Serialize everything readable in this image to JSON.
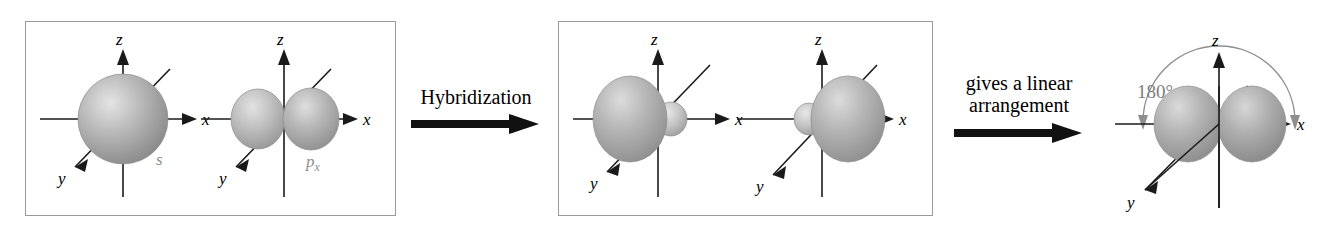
{
  "figure": {
    "background_color": "#ffffff",
    "panel_border_color": "#9a9a9a",
    "orbital_fill_color": "#a8a8a8",
    "orbital_highlight_color": "#dcdcdc",
    "axis_color": "#1a1a1a",
    "label_gray": "#8e8e8e"
  },
  "panels": [
    {
      "id": "reactants",
      "orbitals": [
        {
          "id": "s-orbital",
          "name": "s",
          "shape": "sphere",
          "axes": {
            "x": "x",
            "y": "y",
            "z": "z"
          }
        },
        {
          "id": "p-orbital",
          "name": "px",
          "name_base": "p",
          "name_subscript": "x",
          "shape": "two-equal-lobes",
          "axes": {
            "x": "x",
            "y": "y",
            "z": "z"
          }
        }
      ]
    },
    {
      "id": "hybrids",
      "orbitals": [
        {
          "id": "sp-hybrid-left",
          "name": "",
          "shape": "large-lobe-minus-x",
          "axes": {
            "x": "x",
            "y": "y",
            "z": "z"
          }
        },
        {
          "id": "sp-hybrid-right",
          "name": "",
          "shape": "large-lobe-plus-x",
          "axes": {
            "x": "x",
            "y": "y",
            "z": "z"
          }
        }
      ]
    }
  ],
  "transitions": [
    {
      "id": "hybridization",
      "label": "Hybridization"
    },
    {
      "id": "linear",
      "label": "gives a linear\narrangement"
    }
  ],
  "product": {
    "id": "sp-hybrid-pair",
    "shape": "two-large-lobes-along-x",
    "angle_label": "180°",
    "angle_value": 180,
    "axes": {
      "x": "x",
      "y": "y",
      "z": "z"
    }
  }
}
